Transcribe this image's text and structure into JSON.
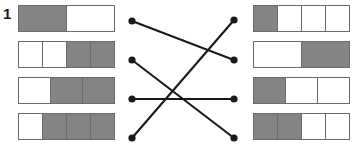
{
  "worksheet": {
    "item_number": "1",
    "colors": {
      "filled": "#848484",
      "empty": "#ffffff",
      "border": "#6b6b6b",
      "line": "#1a1a1a"
    },
    "left_bars": [
      {
        "label": "1/2 shaded",
        "total_cells": 2,
        "filled_cells": 1,
        "pattern": [
          "filled",
          "empty"
        ]
      },
      {
        "label": "2/4 shaded",
        "total_cells": 4,
        "filled_cells": 2,
        "pattern": [
          "empty",
          "empty",
          "filled",
          "filled"
        ]
      },
      {
        "label": "2/3 shaded",
        "total_cells": 3,
        "filled_cells": 2,
        "pattern": [
          "empty",
          "filled",
          "filled"
        ]
      },
      {
        "label": "3/4 shaded",
        "total_cells": 4,
        "filled_cells": 3,
        "pattern": [
          "empty",
          "filled",
          "filled",
          "filled"
        ]
      }
    ],
    "right_bars": [
      {
        "label": "1/4 shaded",
        "total_cells": 4,
        "filled_cells": 1,
        "pattern": [
          "filled",
          "empty",
          "empty",
          "empty"
        ]
      },
      {
        "label": "1/2 shaded",
        "total_cells": 2,
        "filled_cells": 1,
        "pattern": [
          "empty",
          "filled"
        ]
      },
      {
        "label": "1/3 shaded",
        "total_cells": 3,
        "filled_cells": 1,
        "pattern": [
          "filled",
          "empty",
          "empty"
        ]
      },
      {
        "label": "2/4 shaded",
        "total_cells": 4,
        "filled_cells": 2,
        "pattern": [
          "filled",
          "filled",
          "empty",
          "empty"
        ]
      }
    ],
    "left_nodes": [
      {
        "x": 132,
        "y": 21
      },
      {
        "x": 132,
        "y": 60
      },
      {
        "x": 132,
        "y": 99
      },
      {
        "x": 132,
        "y": 138
      }
    ],
    "right_nodes": [
      {
        "x": 234,
        "y": 20
      },
      {
        "x": 234,
        "y": 60
      },
      {
        "x": 234,
        "y": 99
      },
      {
        "x": 234,
        "y": 138
      }
    ],
    "connections": [
      {
        "from": 0,
        "to": 1
      },
      {
        "from": 1,
        "to": 3
      },
      {
        "from": 2,
        "to": 2
      },
      {
        "from": 3,
        "to": 0
      }
    ]
  }
}
